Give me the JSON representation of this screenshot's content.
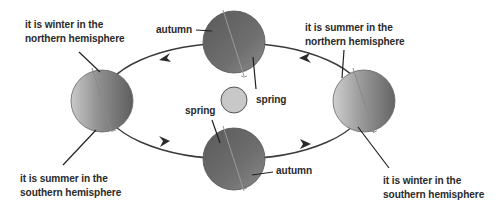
{
  "diagram": {
    "colors": {
      "orbit": "#3a3a3a",
      "globe_dark": "#5c5c5c",
      "globe_mid": "#7a7a7a",
      "globe_light": "#c4c4c4",
      "sun_fill": "#c8c8c8",
      "sun_stroke": "#555555",
      "text": "#2b2b2b"
    },
    "orbit": {
      "cx": 234,
      "cy": 101,
      "rx": 132,
      "ry": 58,
      "direction": "counter-clockwise"
    },
    "sun": {
      "label": "",
      "cx": 234,
      "cy": 100,
      "r": 13
    },
    "positions": [
      {
        "id": "left",
        "cx": 102,
        "cy": 101,
        "labels": {
          "top": [
            "it is winter in the",
            "northern hemisphere"
          ],
          "bottom": [
            "it is summer in the",
            "southern hemisphere"
          ]
        }
      },
      {
        "id": "top",
        "cx": 234,
        "cy": 42,
        "labels": {
          "left": "autumn",
          "right": "spring"
        }
      },
      {
        "id": "right",
        "cx": 364,
        "cy": 101,
        "labels": {
          "top": [
            "it is summer in the",
            "northern hemisphere"
          ],
          "bottom": [
            "it is winter in the",
            "southern hemisphere"
          ]
        }
      },
      {
        "id": "bottom",
        "cx": 234,
        "cy": 159,
        "labels": {
          "left": "spring",
          "right": "autumn"
        }
      }
    ]
  },
  "labels": {
    "left_top_line1": "it is winter in the",
    "left_top_line2": "northern hemisphere",
    "left_bottom_line1": "it is summer in the",
    "left_bottom_line2": "southern hemisphere",
    "right_top_line1": "it is summer in the",
    "right_top_line2": "northern hemisphere",
    "right_bottom_line1": "it is winter in the",
    "right_bottom_line2": "southern hemisphere",
    "top_autumn": "autumn",
    "top_spring": "spring",
    "bottom_spring": "spring",
    "bottom_autumn": "autumn"
  }
}
